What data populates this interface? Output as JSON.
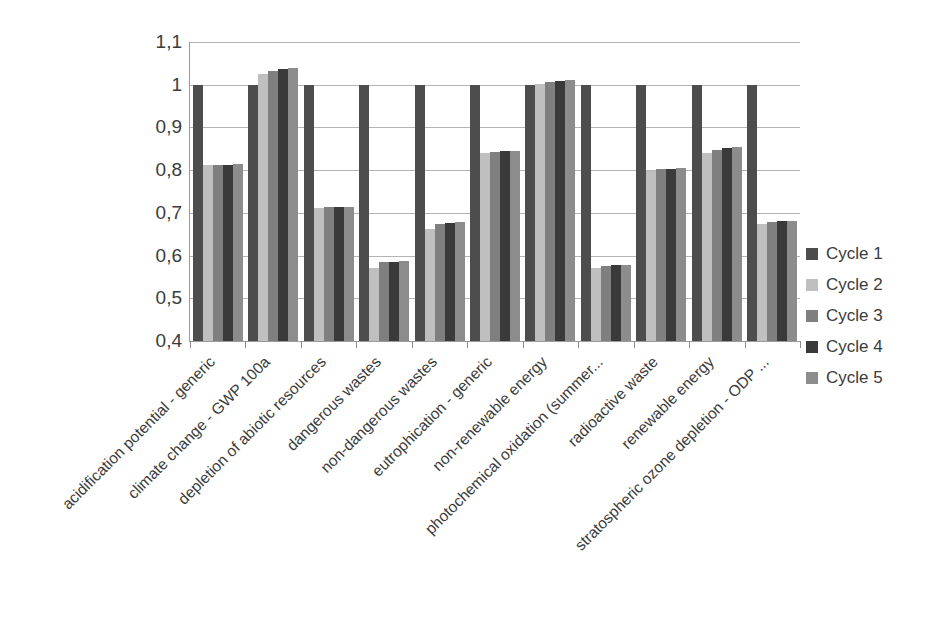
{
  "chart_data": {
    "type": "bar",
    "title": "",
    "subtitle": "",
    "xlabel": "",
    "ylabel": "",
    "ylim": [
      0.4,
      1.1
    ],
    "ytick_labels": [
      "1,1",
      "1",
      "0,9",
      "0,8",
      "0,7",
      "0,6",
      "0,5",
      "0,4"
    ],
    "ytick_values": [
      1.1,
      1.0,
      0.9,
      0.8,
      0.7,
      0.6,
      0.5,
      0.4
    ],
    "grid": true,
    "grid_axis": "y",
    "legend_position": "right",
    "categories": [
      "acidification potential - generic",
      "climate change - GWP 100a",
      "depletion of abiotic resources",
      "dangerous wastes",
      "non-dangerous wastes",
      "eutrophication - generic",
      "non-renewable energy",
      "photochemical oxidation (summer...",
      "radioactive waste",
      "renewable energy",
      "stratospheric ozone depletion - ODP ..."
    ],
    "series": [
      {
        "name": "Cycle 1",
        "color": "#4d4d4d",
        "values": [
          1.0,
          1.0,
          1.0,
          1.0,
          1.0,
          1.0,
          1.0,
          1.0,
          1.0,
          1.0,
          1.0
        ]
      },
      {
        "name": "Cycle 2",
        "color": "#bfbfbf",
        "values": [
          0.811,
          1.025,
          0.711,
          0.572,
          0.662,
          0.84,
          1.002,
          0.57,
          0.799,
          0.841,
          0.673
        ]
      },
      {
        "name": "Cycle 3",
        "color": "#7f7f7f",
        "values": [
          0.813,
          1.032,
          0.713,
          0.584,
          0.674,
          0.843,
          1.006,
          0.576,
          0.802,
          0.847,
          0.678
        ]
      },
      {
        "name": "Cycle 4",
        "color": "#3a3a3a",
        "values": [
          0.813,
          1.036,
          0.713,
          0.586,
          0.677,
          0.844,
          1.009,
          0.578,
          0.803,
          0.851,
          0.68
        ]
      },
      {
        "name": "Cycle 5",
        "color": "#8c8c8c",
        "values": [
          0.815,
          1.04,
          0.714,
          0.588,
          0.679,
          0.845,
          1.01,
          0.579,
          0.805,
          0.855,
          0.682
        ]
      }
    ]
  },
  "legend": {
    "items": [
      {
        "label": "Cycle 1",
        "color": "#4d4d4d"
      },
      {
        "label": "Cycle 2",
        "color": "#bfbfbf"
      },
      {
        "label": "Cycle 3",
        "color": "#7f7f7f"
      },
      {
        "label": "Cycle 4",
        "color": "#3a3a3a"
      },
      {
        "label": "Cycle 5",
        "color": "#8c8c8c"
      }
    ]
  },
  "colors": {
    "gridline": "#b3b3b3",
    "axis": "#9a9a9a",
    "text": "#3b3b3b",
    "background": "#ffffff"
  }
}
